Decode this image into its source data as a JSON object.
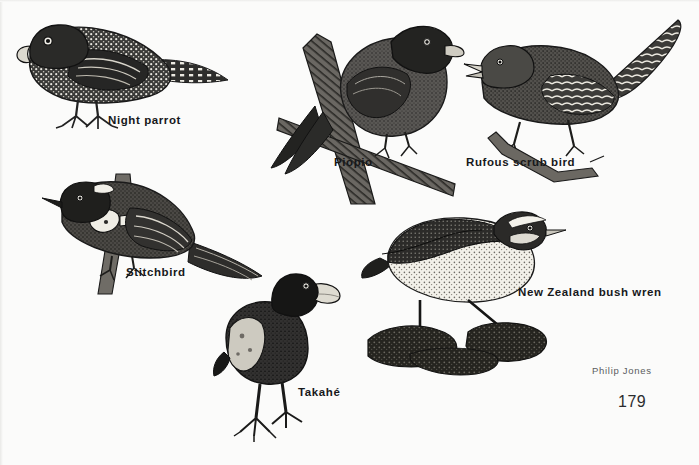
{
  "page": {
    "width": 699,
    "height": 465,
    "background_color": "#fbfbfa",
    "ink_color": "#1a1a1a",
    "medium": "pen-and-ink scraperboard illustration"
  },
  "figures": [
    {
      "id": "night-parrot",
      "label": "Night parrot",
      "label_x": 108,
      "label_y": 120,
      "description": "Stocky mottled dark parrot facing left, standing on short legs, long barred tail extending right",
      "bounds": {
        "x": 8,
        "y": 16,
        "width": 210,
        "height": 118
      }
    },
    {
      "id": "piopio",
      "label": "Piopio",
      "label_x": 334,
      "label_y": 162,
      "description": "Thrush-like bird facing right, perched on a diagonal broken branch, long tail angled down-left",
      "bounds": {
        "x": 262,
        "y": 14,
        "width": 196,
        "height": 196
      }
    },
    {
      "id": "rufous-scrub-bird",
      "label": "Rufous scrub bird",
      "label_x": 466,
      "label_y": 162,
      "description": "Small brown bird facing left with open bill, barred flanks, long tail cocked upward to the right, gripping a thin twig",
      "bounds": {
        "x": 474,
        "y": 18,
        "width": 216,
        "height": 166
      }
    },
    {
      "id": "stitchbird",
      "label": "Stitchbird",
      "label_x": 126,
      "label_y": 272,
      "description": "Honeyeater facing left with dark head, white ear tuft and pale wing bars, perched on an upright branch",
      "bounds": {
        "x": 44,
        "y": 170,
        "width": 218,
        "height": 122
      }
    },
    {
      "id": "takahe",
      "label": "Takahé",
      "label_x": 298,
      "label_y": 392,
      "description": "Heavy flightless rail standing upright facing right, massive pale bill, long legs and splayed toes",
      "bounds": {
        "x": 218,
        "y": 272,
        "width": 112,
        "height": 168
      }
    },
    {
      "id": "new-zealand-bush-wren",
      "label": "New Zealand bush wren",
      "label_x": 518,
      "label_y": 292,
      "description": "Plump short-tailed wren facing right with pale speckled underparts, dark back and white eyebrow stripe, standing on dark rocks",
      "bounds": {
        "x": 366,
        "y": 200,
        "width": 190,
        "height": 170
      }
    }
  ],
  "credit": {
    "text": "Philip Jones",
    "x": 592,
    "y": 371
  },
  "folio": {
    "number": "179",
    "x": 618,
    "y": 400
  }
}
